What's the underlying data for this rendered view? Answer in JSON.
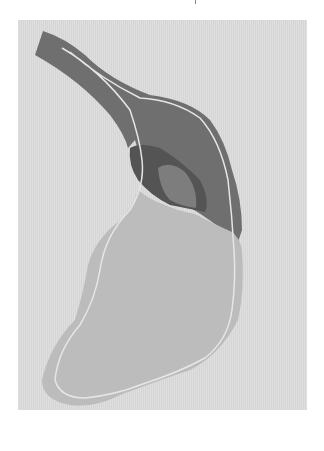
{
  "image": {
    "description": "Photograph of a layered paper/fabric cutout shaped like a foot with a long dark upper strap",
    "colors": {
      "background": "#ffffff",
      "mat": "#dcdcdc",
      "dark_shape": "#6f6f6f",
      "darker_inset": "#4f4f4f",
      "mid_inset": "#7d7d7d",
      "light_shape": "#b9b9b9",
      "stitch_line": "#e6e6e6"
    }
  }
}
